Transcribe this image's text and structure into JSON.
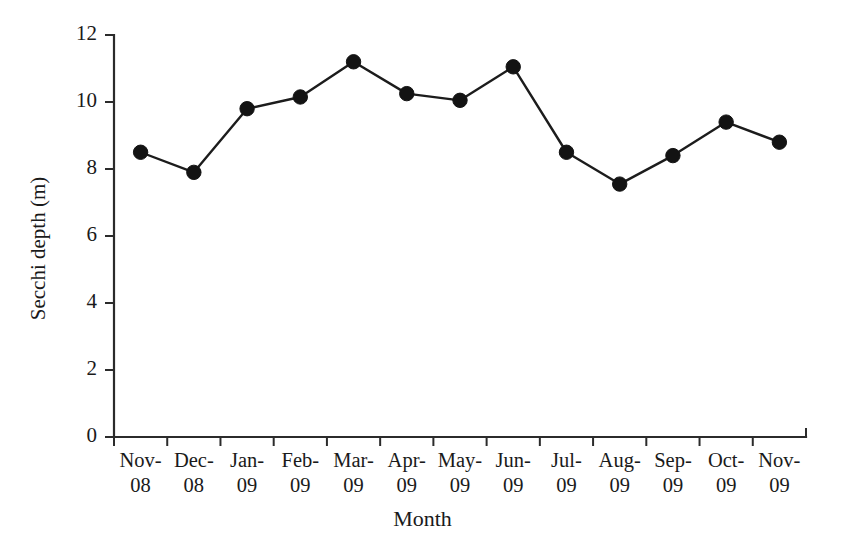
{
  "chart_data": {
    "type": "line",
    "title": "",
    "xlabel": "Month",
    "ylabel": "Secchi depth (m)",
    "categories": [
      "Nov-08",
      "Dec-08",
      "Jan-09",
      "Feb-09",
      "Mar-09",
      "Apr-09",
      "May-09",
      "Jun-09",
      "Jul-09",
      "Aug-09",
      "Sep-09",
      "Oct-09",
      "Nov-09"
    ],
    "category_lines": [
      {
        "l1": "Nov-",
        "l2": "08"
      },
      {
        "l1": "Dec-",
        "l2": "08"
      },
      {
        "l1": "Jan-",
        "l2": "09"
      },
      {
        "l1": "Feb-",
        "l2": "09"
      },
      {
        "l1": "Mar-",
        "l2": "09"
      },
      {
        "l1": "Apr-",
        "l2": "09"
      },
      {
        "l1": "May-",
        "l2": "09"
      },
      {
        "l1": "Jun-",
        "l2": "09"
      },
      {
        "l1": "Jul-",
        "l2": "09"
      },
      {
        "l1": "Aug-",
        "l2": "09"
      },
      {
        "l1": "Sep-",
        "l2": "09"
      },
      {
        "l1": "Oct-",
        "l2": "09"
      },
      {
        "l1": "Nov-",
        "l2": "09"
      }
    ],
    "values": [
      8.5,
      7.9,
      9.8,
      10.15,
      11.2,
      10.25,
      10.05,
      11.05,
      8.5,
      7.55,
      8.4,
      9.4,
      8.8
    ],
    "ylim": [
      0,
      12
    ],
    "yticks": [
      0,
      2,
      4,
      6,
      8,
      10,
      12
    ],
    "ytick_labels": [
      "0",
      "2",
      "4",
      "6",
      "8",
      "10",
      "12"
    ],
    "grid": false,
    "legend": "none",
    "marker": "filled-circle",
    "series_color": "#131313",
    "axis_color": "#2b2b2b"
  }
}
